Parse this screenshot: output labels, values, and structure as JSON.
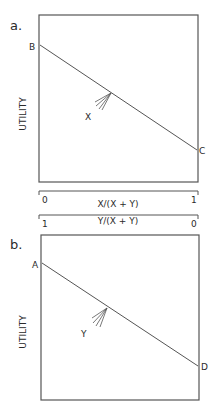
{
  "panels": [
    {
      "id": "a",
      "label": "a.",
      "ylabel": "UTILITY",
      "line_start_label": "B",
      "line_end_label": "C",
      "arrow_label": "X"
    },
    {
      "id": "b",
      "label": "b.",
      "ylabel": "UTILITY",
      "line_start_label": "A",
      "line_end_label": "D",
      "arrow_label": "Y"
    }
  ],
  "axes": [
    {
      "title": "X/(X + Y)",
      "left_tick": "0",
      "right_tick": "1"
    },
    {
      "title": "Y/(X + Y)",
      "left_tick": "1",
      "right_tick": "0"
    }
  ],
  "colors": {
    "line": "#555555",
    "text": "#2a2a2a"
  }
}
